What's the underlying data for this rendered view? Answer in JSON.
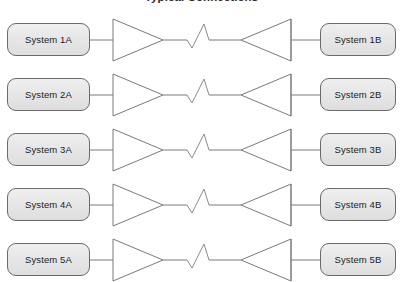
{
  "diagram": {
    "title": "Typical Connections",
    "background_color": "#ffffff",
    "box_fill_color": "#e7e7e7",
    "box_border_color": "#6a6a6a",
    "line_color": "#7a7a7a",
    "row_count": 5,
    "rows": [
      {
        "left_label": "System 1A",
        "right_label": "System 1B",
        "left_amplifier": "amplifier-triangle-right-icon",
        "link": "lightning-zigzag-icon",
        "right_amplifier": "amplifier-triangle-left-icon"
      },
      {
        "left_label": "System 2A",
        "right_label": "System 2B",
        "left_amplifier": "amplifier-triangle-right-icon",
        "link": "lightning-zigzag-icon",
        "right_amplifier": "amplifier-triangle-left-icon"
      },
      {
        "left_label": "System 3A",
        "right_label": "System 3B",
        "left_amplifier": "amplifier-triangle-right-icon",
        "link": "lightning-zigzag-icon",
        "right_amplifier": "amplifier-triangle-left-icon"
      },
      {
        "left_label": "System 4A",
        "right_label": "System 4B",
        "left_amplifier": "amplifier-triangle-right-icon",
        "link": "lightning-zigzag-icon",
        "right_amplifier": "amplifier-triangle-left-icon"
      },
      {
        "left_label": "System 5A",
        "right_label": "System 5B",
        "left_amplifier": "amplifier-triangle-right-icon",
        "link": "lightning-zigzag-icon",
        "right_amplifier": "amplifier-triangle-left-icon"
      }
    ]
  }
}
